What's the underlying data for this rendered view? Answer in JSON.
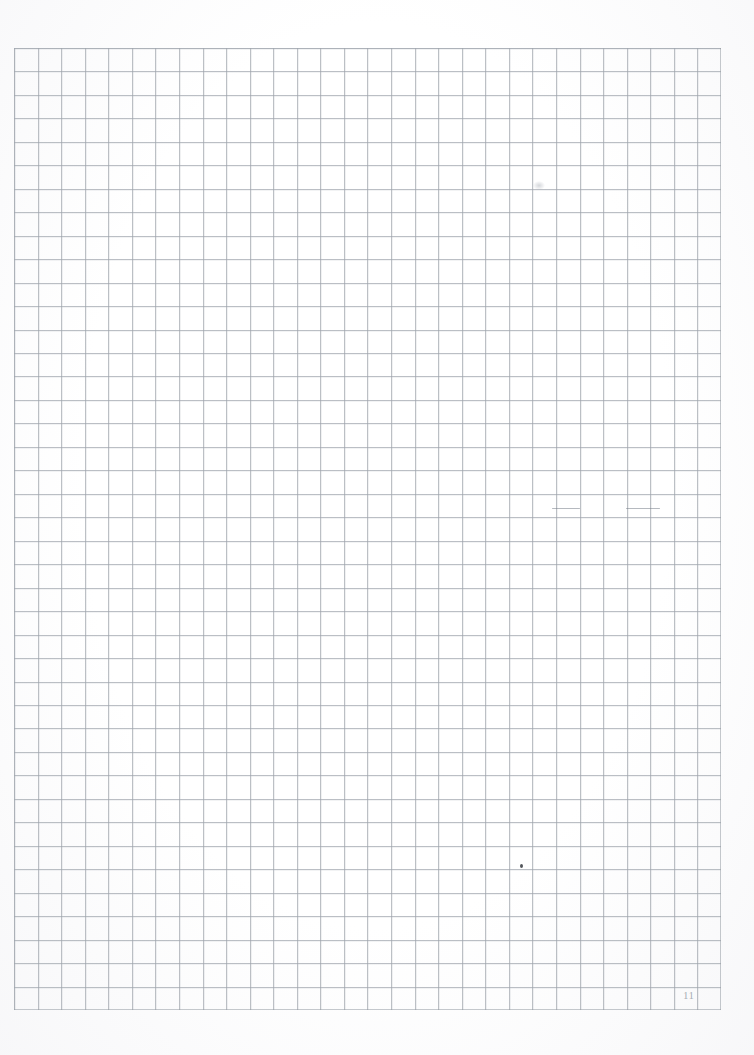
{
  "page": {
    "kind": "scanned-squared-graph-paper",
    "page_number": "11",
    "background_color": "#ffffff",
    "grid_line_color": "#969ca4",
    "pencil_mark_color": "#78808a",
    "page_number_color": "#a0a6ae"
  },
  "grid": {
    "origin_x_px": 14,
    "origin_y_px": 48,
    "width_px": 707,
    "height_px": 962,
    "cell_width_px": 23.57,
    "cell_height_px": 23.46,
    "columns": 30,
    "rows": 41,
    "line_weight_px": 1,
    "style": "square ruled / quadrille"
  },
  "marks": [
    {
      "name": "pencil-stroke-left",
      "type": "horizontal-stroke",
      "x": 552,
      "y": 508,
      "w": 28,
      "h": 1
    },
    {
      "name": "pencil-stroke-right",
      "type": "horizontal-stroke",
      "x": 626,
      "y": 508,
      "w": 34,
      "h": 1
    },
    {
      "name": "pencil-dot",
      "type": "dot",
      "x": 520,
      "y": 864,
      "w": 3,
      "h": 4
    },
    {
      "name": "pencil-smudge-upper",
      "type": "smudge",
      "x": 533,
      "y": 181,
      "w": 12,
      "h": 9
    }
  ],
  "content": {
    "written_text": "",
    "note": "blank ruled page"
  }
}
